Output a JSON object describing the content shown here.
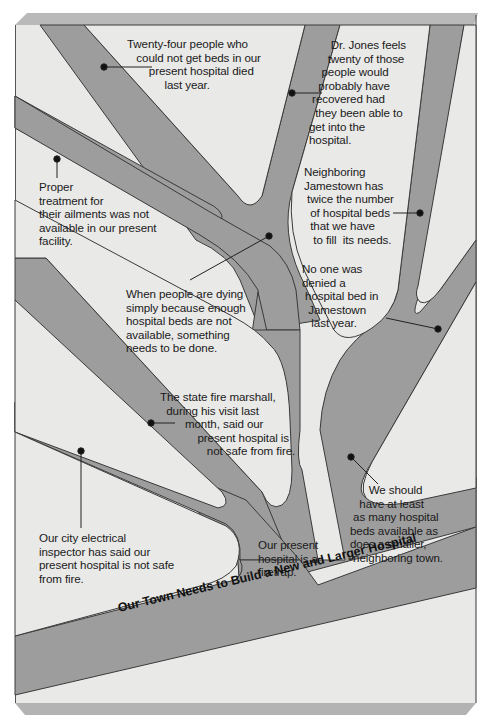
{
  "diagram": {
    "type": "argument-tree",
    "colors": {
      "page_background": "#ffffff",
      "board_face": "#e9e9e8",
      "branch_fill": "#9d9d9d",
      "outline": "#3a3a3a",
      "bevel_top": "#b8b8b8",
      "bevel_bottom": "#b4b4b4",
      "text": "#1a1a1a"
    },
    "conclusion": "Our Town Needs to Build a New and Larger Hospital",
    "branches": [
      {
        "id": "twenty-four-died",
        "text": "Twenty-four people who\n   could not get beds in our\n       present hospital died\n            last year."
      },
      {
        "id": "dr-jones",
        "text": "       Dr. Jones feels\n      twenty of those\n    people would\n   probably have\n recovered had\n  they been able to\nget into the\nhospital."
      },
      {
        "id": "proper-treatment",
        "text": "Proper\ntreatment for\ntheir ailments was not\navailable in our present\nfacility."
      },
      {
        "id": "people-dying",
        "text": "When people are dying\nsimply because enough\nhospital beds are not\navailable, something\nneeds to be done."
      },
      {
        "id": "jamestown-twice",
        "text": "Neighboring\nJamestown has\n twice the number\n  of hospital beds\n  that we have\n   to fill  its needs."
      },
      {
        "id": "no-one-denied",
        "text": "No one was\ndenied a\n hospital bed in\n  Jamestown\n   last year."
      },
      {
        "id": "fire-marshall",
        "text": "The state fire marshall,\n  during his visit last\n        month, said our\n            present hospital is\n               not safe from fire."
      },
      {
        "id": "electrical-inspector",
        "text": "Our city electrical\ninspector has said our\npresent hospital is not safe\nfrom fire."
      },
      {
        "id": "firetrap",
        "text": "Our present\nhospital is a\nfiretrap."
      },
      {
        "id": "as-many-beds",
        "text": "      We should\n   have at least\n as many hospital\nbeds available as\ndoes a smaller,\n neighboring town."
      }
    ]
  }
}
